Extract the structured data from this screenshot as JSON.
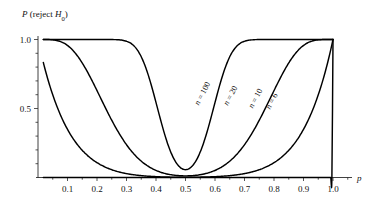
{
  "chart_data": {
    "type": "line",
    "title": "",
    "ylabel": "P (reject H0)",
    "ylabel_parts": {
      "symbol": "P",
      "text": " (reject ",
      "sub_symbol": "H",
      "subscript": "0",
      "close": ")"
    },
    "xlabel": "p",
    "xlim": [
      0.0,
      1.08
    ],
    "ylim": [
      0.0,
      1.06
    ],
    "grid": false,
    "legend": "inline-curve-labels",
    "x_ticks": [
      0.1,
      0.2,
      0.3,
      0.4,
      0.5,
      0.6,
      0.7,
      0.8,
      0.9,
      1.0
    ],
    "x_tick_labels": [
      "0.1",
      "0.2",
      "0.3",
      "0.4",
      "0.5",
      "0.6",
      "0.7",
      "0.8",
      "0.9",
      "1.0"
    ],
    "x_minor_ticks": [
      0.05,
      0.15,
      0.25,
      0.35,
      0.45,
      0.55,
      0.65,
      0.75,
      0.85,
      0.95,
      1.05
    ],
    "y_ticks": [
      0.5,
      1.0
    ],
    "y_tick_labels": [
      "0.5",
      "1.0"
    ],
    "y_minor_ticks": [
      0.1,
      0.2,
      0.3,
      0.4,
      0.6,
      0.7,
      0.8,
      0.9
    ],
    "x": [
      0.02,
      0.05,
      0.1,
      0.15,
      0.2,
      0.25,
      0.3,
      0.35,
      0.4,
      0.45,
      0.5,
      0.55,
      0.6,
      0.65,
      0.7,
      0.75,
      0.8,
      0.85,
      0.9,
      0.95,
      1.0
    ],
    "series": [
      {
        "name": "n = 100",
        "label": "n = 100",
        "n": 100,
        "label_x": 0.565,
        "label_y": 0.6,
        "label_rotation": -62,
        "values": [
          1.0,
          1.0,
          1.0,
          1.0,
          1.0,
          1.0,
          0.998,
          0.978,
          0.855,
          0.5,
          0.03,
          0.5,
          0.855,
          0.978,
          0.998,
          1.0,
          1.0,
          1.0,
          1.0,
          1.0,
          1.0
        ]
      },
      {
        "name": "n = 20",
        "label": "n = 20",
        "n": 20,
        "label_x": 0.66,
        "label_y": 0.585,
        "label_rotation": -62,
        "values": [
          1.0,
          0.998,
          0.985,
          0.955,
          0.905,
          0.83,
          0.73,
          0.61,
          0.46,
          0.28,
          0.03,
          0.28,
          0.46,
          0.61,
          0.73,
          0.83,
          0.905,
          0.955,
          0.985,
          0.998,
          1.0
        ]
      },
      {
        "name": "n = 10",
        "label": "n = 10",
        "n": 10,
        "label_x": 0.745,
        "label_y": 0.565,
        "label_rotation": -62,
        "values": [
          1.0,
          0.982,
          0.93,
          0.868,
          0.8,
          0.726,
          0.646,
          0.558,
          0.448,
          0.29,
          0.03,
          0.29,
          0.448,
          0.558,
          0.646,
          0.726,
          0.8,
          0.868,
          0.93,
          0.982,
          1.0
        ]
      },
      {
        "name": "n = 6",
        "label": "n = 6",
        "n": 6,
        "label_x": 0.8,
        "label_y": 0.545,
        "label_rotation": -62,
        "values": [
          1.0,
          0.972,
          0.905,
          0.832,
          0.756,
          0.678,
          0.596,
          0.508,
          0.404,
          0.262,
          0.03,
          0.262,
          0.404,
          0.508,
          0.596,
          0.678,
          0.756,
          0.832,
          0.905,
          0.972,
          1.0
        ]
      }
    ]
  },
  "colors": {
    "curve": "#000000",
    "axis": "#2b2b2b",
    "text": "#111111",
    "background": "#ffffff"
  }
}
